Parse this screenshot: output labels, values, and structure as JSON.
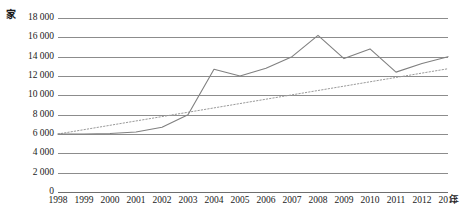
{
  "chart_data": {
    "type": "line",
    "title": "",
    "xlabel": "年",
    "ylabel": "家",
    "x": [
      1998,
      1999,
      2000,
      2001,
      2002,
      2003,
      2004,
      2005,
      2006,
      2007,
      2008,
      2009,
      2010,
      2011,
      2012,
      2013
    ],
    "categories": [
      "1998",
      "1999",
      "2000",
      "2001",
      "2002",
      "2003",
      "2004",
      "2005",
      "2006",
      "2007",
      "2008",
      "2009",
      "2010",
      "2011",
      "2012",
      "2013"
    ],
    "series": [
      {
        "name": "数量",
        "style": "solid",
        "color": "#808080",
        "values": [
          6000,
          6000,
          6050,
          6200,
          6700,
          8000,
          12700,
          12000,
          12800,
          14000,
          16200,
          13800,
          14800,
          12400,
          13300,
          14000
        ]
      },
      {
        "name": "趋势线",
        "style": "dotted",
        "color": "#9a9a9a",
        "values": [
          6000,
          6450,
          6900,
          7350,
          7800,
          8250,
          8700,
          9150,
          9600,
          10050,
          10500,
          10950,
          11400,
          11850,
          12300,
          12750
        ]
      }
    ],
    "ylim": [
      0,
      18000
    ],
    "ytick_step": 2000,
    "ytick_labels": [
      "0",
      "2 000",
      "4 000",
      "6 000",
      "8 000",
      "10 000",
      "12 000",
      "14 000",
      "16 000",
      "18 000"
    ],
    "ytick_values": [
      0,
      2000,
      4000,
      6000,
      8000,
      10000,
      12000,
      14000,
      16000,
      18000
    ],
    "grid": true,
    "legend": "none",
    "annotations": []
  },
  "axes": {
    "y_unit_label": "家",
    "x_unit_label": "年"
  }
}
